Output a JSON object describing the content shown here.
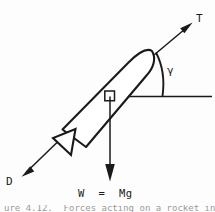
{
  "figure": {
    "kind": "free-body-diagram",
    "subject": "rocket in flight",
    "background_color": "#fdfdfd",
    "ink_color": "#1a1a1a"
  },
  "labels": {
    "thrust": "T",
    "drag": "D",
    "angle": "γ",
    "weight": "W  =  Mg"
  },
  "caption": {
    "clipped_text": "ure 4.12.  Forces acting on a rocket in flight"
  },
  "icons": {
    "thrust_arrow": "arrow-up-right-icon",
    "drag_arrow": "arrow-down-left-icon",
    "weight_arrow": "arrow-down-icon",
    "right_angle": "right-angle-marker-icon",
    "angle_arc": "angle-arc-icon",
    "rocket": "rocket-body-icon",
    "horizon": "horizontal-reference-line-icon"
  }
}
